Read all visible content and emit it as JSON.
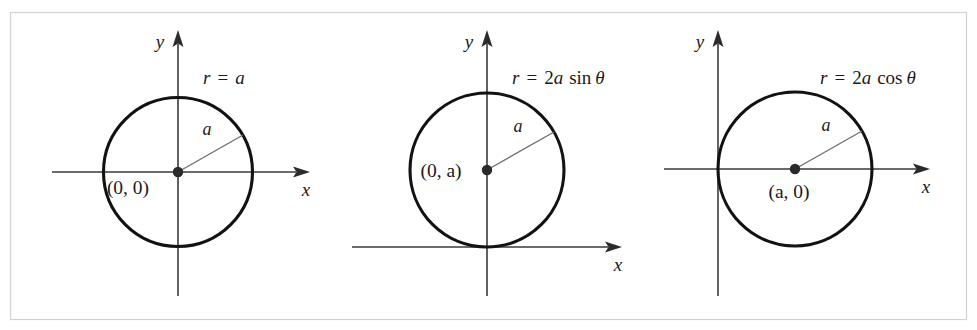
{
  "figure": {
    "caption_fragment": "",
    "border_color": "#d2d2d2",
    "background": "#ffffff",
    "curve_color": "#121212",
    "axis_color": "#3a3a3a",
    "radius_color": "#6b6b6b"
  },
  "panels": [
    {
      "id": "panel-1",
      "equation_lhs": "r",
      "equation_eq": "=",
      "equation_rhs_coeff": "",
      "equation_rhs_var": "a",
      "equation_rhs_func": "",
      "equation_rhs_theta": "",
      "equation_full": "r = a",
      "x_axis_label": "x",
      "y_axis_label": "y",
      "center_label": "(0, 0)",
      "radius_label": "a",
      "center_x": 0,
      "center_y": 0,
      "radius": 1
    },
    {
      "id": "panel-2",
      "equation_lhs": "r",
      "equation_eq": "=",
      "equation_rhs_coeff": "2",
      "equation_rhs_var": "a",
      "equation_rhs_func": "sin",
      "equation_rhs_theta": "θ",
      "equation_full": "r = 2a sin θ",
      "x_axis_label": "x",
      "y_axis_label": "y",
      "center_label": "(0, a)",
      "radius_label": "a",
      "center_x": 0,
      "center_y": 1,
      "radius": 1
    },
    {
      "id": "panel-3",
      "equation_lhs": "r",
      "equation_eq": "=",
      "equation_rhs_coeff": "2",
      "equation_rhs_var": "a",
      "equation_rhs_func": "cos",
      "equation_rhs_theta": "θ",
      "equation_full": "r = 2a cos θ",
      "x_axis_label": "x",
      "y_axis_label": "y",
      "center_label": "(a, 0)",
      "radius_label": "a",
      "center_x": 1,
      "center_y": 0,
      "radius": 1
    }
  ]
}
